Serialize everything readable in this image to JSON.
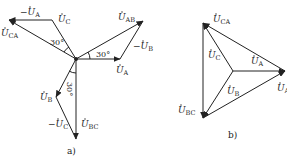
{
  "panel_a": {
    "caption": "a)",
    "labels": {
      "neg_UA": {
        "prefix": "−",
        "base": "U",
        "sub": "A"
      },
      "UC": {
        "prefix": "",
        "base": "U",
        "sub": "C"
      },
      "UCA": {
        "prefix": "",
        "base": "U",
        "sub": "CA"
      },
      "UAB": {
        "prefix": "",
        "base": "U",
        "sub": "AB"
      },
      "neg_UB": {
        "prefix": "−",
        "base": "U",
        "sub": "B"
      },
      "UA": {
        "prefix": "",
        "base": "U",
        "sub": "A"
      },
      "UB": {
        "prefix": "",
        "base": "U",
        "sub": "B"
      },
      "neg_UC": {
        "prefix": "−",
        "base": "U",
        "sub": "C"
      },
      "UBC": {
        "prefix": "",
        "base": "U",
        "sub": "BC"
      }
    },
    "angles": {
      "top_left": "30°",
      "right": "30°",
      "bottom": "30°"
    }
  },
  "panel_b": {
    "caption": "b)",
    "labels": {
      "UCA": {
        "base": "U",
        "sub": "CA"
      },
      "UC": {
        "base": "U",
        "sub": "C"
      },
      "UA": {
        "base": "U",
        "sub": "A"
      },
      "UB": {
        "base": "U",
        "sub": "B"
      },
      "UBC": {
        "base": "U",
        "sub": "BC"
      },
      "UAB_cut": {
        "base": "U",
        "sub": "A"
      }
    }
  }
}
